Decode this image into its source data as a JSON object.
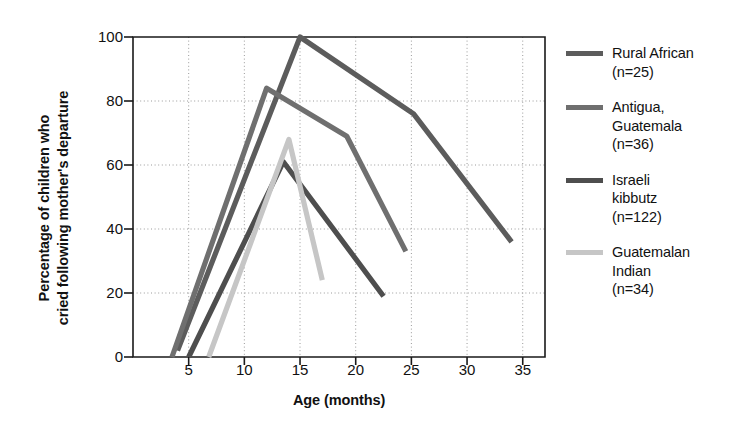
{
  "chart_data": {
    "type": "line",
    "title": "",
    "xlabel": "Age (months)",
    "ylabel": "Percentage of children who cried following mother's departure",
    "ylabel_lines": [
      "Percentage of children who",
      "cried following mother's departure"
    ],
    "xlim": [
      0,
      37
    ],
    "ylim": [
      0,
      100
    ],
    "xticks": [
      5,
      10,
      15,
      20,
      25,
      30,
      35
    ],
    "yticks": [
      0,
      20,
      40,
      60,
      80,
      100
    ],
    "xtick_labels": [
      "5",
      "10",
      "15",
      "20",
      "25",
      "30",
      "35"
    ],
    "ytick_labels": [
      "0",
      "20",
      "40",
      "60",
      "80",
      "100"
    ],
    "grid": true,
    "grid_style": "dotted",
    "legend_position": "right",
    "series": [
      {
        "name": "Rural African",
        "label_lines": [
          "Rural African",
          "(n=25)"
        ],
        "n": 25,
        "color": "#5c5c5c",
        "x": [
          4.0,
          15.0,
          25.2,
          34.0
        ],
        "y": [
          2,
          100,
          76,
          36
        ]
      },
      {
        "name": "Antigua, Guatemala",
        "label_lines": [
          "Antigua,",
          "Guatemala",
          "(n=36)"
        ],
        "n": 36,
        "color": "#6f6f6f",
        "x": [
          3.5,
          12.0,
          19.2,
          24.5
        ],
        "y": [
          0,
          84,
          69,
          33
        ]
      },
      {
        "name": "Israeli kibbutz",
        "label_lines": [
          "Israeli",
          "kibbutz",
          "(n=122)"
        ],
        "n": 122,
        "color": "#4e4e4e",
        "x": [
          5.0,
          13.5,
          22.5
        ],
        "y": [
          0,
          61,
          19
        ]
      },
      {
        "name": "Guatemalan Indian",
        "label_lines": [
          "Guatemalan",
          "Indian",
          "(n=34)"
        ],
        "n": 34,
        "color": "#c6c6c6",
        "x": [
          6.8,
          14.0,
          17.0
        ],
        "y": [
          0,
          68,
          24
        ]
      }
    ]
  },
  "axis": {
    "x_title": "Age (months)",
    "y_title_line1": "Percentage of children who",
    "y_title_line2": "cried following mother's departure"
  },
  "legend": {
    "entries": [
      {
        "text": "Rural African\n(n=25)",
        "color": "#5c5c5c"
      },
      {
        "text": "Antigua,\nGuatemala\n(n=36)",
        "color": "#6f6f6f"
      },
      {
        "text": "Israeli\nkibbutz\n(n=122)",
        "color": "#4e4e4e"
      },
      {
        "text": "Guatemalan\nIndian\n(n=34)",
        "color": "#c6c6c6"
      }
    ]
  },
  "colors": {
    "axis": "#1a1a1a",
    "grid": "#9a9a9a",
    "background": "#ffffff"
  }
}
